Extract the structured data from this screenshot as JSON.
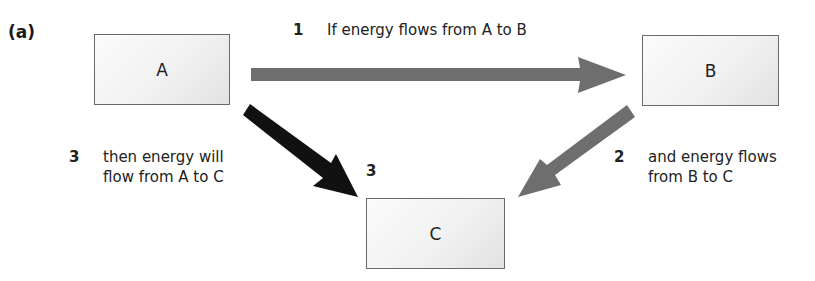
{
  "figure": {
    "panel_label": "(a)",
    "nodes": {
      "a": {
        "label": "A"
      },
      "b": {
        "label": "B"
      },
      "c": {
        "label": "C"
      }
    },
    "steps": [
      {
        "number": "1",
        "text": "If energy flows from A to B"
      },
      {
        "number": "2",
        "text": "and energy flows\nfrom B to C"
      },
      {
        "number": "3",
        "text": "then energy will\nflow from A to C"
      }
    ],
    "arrow_marker_label": "3",
    "colors": {
      "arrow_gray": "#6e6e6e",
      "arrow_black": "#111111",
      "box_border": "#6a6a6a",
      "box_fill": "#f1f1f1"
    }
  }
}
